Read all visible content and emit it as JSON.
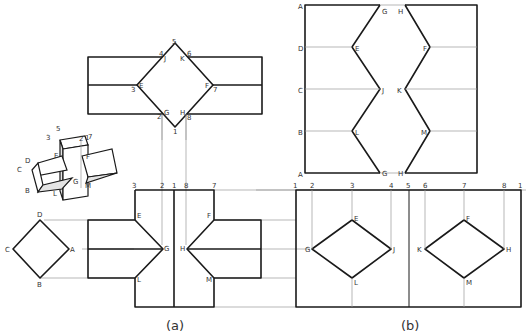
{
  "figure": {
    "captions": {
      "a": "(a)",
      "b": "(b)"
    },
    "top_view_labels": {
      "n5": "5",
      "n4": "4",
      "J": "J",
      "K": "K",
      "n6": "6",
      "n3": "3",
      "E": "E",
      "F": "F",
      "n7": "7",
      "n2": "2",
      "G": "G",
      "H": "H",
      "n8": "8",
      "n1": "1"
    },
    "side_square_labels": {
      "D": "D",
      "C": "C",
      "A": "A",
      "B": "B"
    },
    "front_view_labels": {
      "n3": "3",
      "n2": "2",
      "n1": "1",
      "n8": "8",
      "n7": "7",
      "E": "E",
      "F": "F",
      "G": "G",
      "H": "H",
      "L": "L",
      "M": "M"
    },
    "pictorial_labels": {
      "n5": "5",
      "n3": "3",
      "n2": "2",
      "n1": "1",
      "n8": "8",
      "n7": "7",
      "E": "E",
      "F": "F",
      "D": "D",
      "C": "C",
      "A": "A",
      "B": "B",
      "G": "G",
      "L": "L",
      "M": "M"
    },
    "upper_development_labels": {
      "A1": "A",
      "D": "D",
      "C": "C",
      "B": "B",
      "A2": "A",
      "G1": "G",
      "E": "E",
      "J": "J",
      "L": "L",
      "G2": "G",
      "H1": "H",
      "F": "F",
      "K": "K",
      "M": "M",
      "H2": "H"
    },
    "lower_development_labels": {
      "n1a": "1",
      "n2": "2",
      "n3": "3",
      "n4": "4",
      "n5": "5",
      "n6": "6",
      "n7": "7",
      "n8": "8",
      "n1b": "1",
      "E": "E",
      "G": "G",
      "J": "J",
      "L": "L",
      "F": "F",
      "K": "K",
      "H": "H",
      "M": "M"
    }
  }
}
